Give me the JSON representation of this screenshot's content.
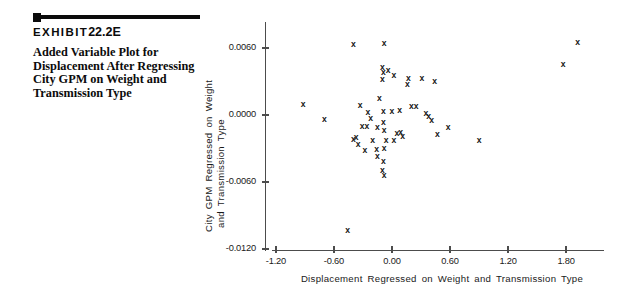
{
  "exhibit": {
    "label_prefix": "EXHIBIT",
    "label_number": "22.2E",
    "caption": "Added Variable Plot for Displacement After Regressing City GPM on Weight and Transmission Type"
  },
  "chart_data": {
    "type": "scatter",
    "title": "",
    "xlabel": "Displacement Regressed on Weight and Transmission Type",
    "ylabel": "City GPM Regressed on Weight and Transmission Type",
    "ylabel_line1": "City GPM Regressed on Weight",
    "ylabel_line2": "and Transmission Type",
    "marker": "x",
    "grid": false,
    "legend": "none",
    "xlim": [
      -1.42,
      2.0
    ],
    "ylim": [
      -0.0135,
      0.0085
    ],
    "xticks": [
      -1.2,
      -0.6,
      0.0,
      0.6,
      1.2,
      1.8
    ],
    "xtick_labels": [
      "-1.20",
      "-0.60",
      "0.00",
      "0.60",
      "1.20",
      "1.80"
    ],
    "yticks": [
      0.006,
      0.0,
      -0.006,
      -0.012
    ],
    "ytick_labels": [
      "0.0060",
      "0.0000",
      "-0.0060",
      "-0.0120"
    ],
    "points": [
      {
        "x": -0.4,
        "y": 0.00635
      },
      {
        "x": -0.08,
        "y": 0.0064
      },
      {
        "x": -0.92,
        "y": 0.0009
      },
      {
        "x": -0.7,
        "y": -0.0004
      },
      {
        "x": -0.1,
        "y": 0.00425
      },
      {
        "x": -0.09,
        "y": 0.00385
      },
      {
        "x": -0.04,
        "y": 0.004
      },
      {
        "x": -0.1,
        "y": 0.00315
      },
      {
        "x": 0.02,
        "y": 0.00355
      },
      {
        "x": 0.17,
        "y": 0.0033
      },
      {
        "x": 0.31,
        "y": 0.0033
      },
      {
        "x": 0.16,
        "y": 0.00275
      },
      {
        "x": 0.44,
        "y": 0.003
      },
      {
        "x": -0.33,
        "y": 0.00085
      },
      {
        "x": -0.13,
        "y": 0.0015
      },
      {
        "x": -0.25,
        "y": 0.0002
      },
      {
        "x": -0.22,
        "y": -0.00035
      },
      {
        "x": -0.09,
        "y": 0.00035
      },
      {
        "x": 0.0,
        "y": 0.0003
      },
      {
        "x": 0.08,
        "y": 0.0004
      },
      {
        "x": 0.2,
        "y": 0.00075
      },
      {
        "x": 0.25,
        "y": 0.00075
      },
      {
        "x": 0.35,
        "y": 0.0001
      },
      {
        "x": 0.38,
        "y": -0.0001
      },
      {
        "x": 0.41,
        "y": -0.00045
      },
      {
        "x": -0.31,
        "y": -0.001
      },
      {
        "x": -0.26,
        "y": -0.00105
      },
      {
        "x": -0.15,
        "y": -0.0011
      },
      {
        "x": -0.09,
        "y": -0.0007
      },
      {
        "x": -0.08,
        "y": -0.00135
      },
      {
        "x": 0.05,
        "y": -0.00165
      },
      {
        "x": 0.09,
        "y": -0.00155
      },
      {
        "x": 0.11,
        "y": -0.00195
      },
      {
        "x": 0.58,
        "y": -0.00115
      },
      {
        "x": -0.4,
        "y": -0.00215
      },
      {
        "x": -0.37,
        "y": -0.00205
      },
      {
        "x": -0.35,
        "y": -0.00265
      },
      {
        "x": -0.2,
        "y": -0.0023
      },
      {
        "x": -0.06,
        "y": -0.00225
      },
      {
        "x": 0.02,
        "y": -0.0023
      },
      {
        "x": -0.28,
        "y": -0.0032
      },
      {
        "x": -0.16,
        "y": -0.0031
      },
      {
        "x": -0.08,
        "y": -0.003
      },
      {
        "x": -0.15,
        "y": -0.0037
      },
      {
        "x": -0.09,
        "y": -0.00415
      },
      {
        "x": -0.1,
        "y": -0.005
      },
      {
        "x": -0.08,
        "y": -0.00545
      },
      {
        "x": 0.47,
        "y": -0.00175
      },
      {
        "x": 0.9,
        "y": -0.0023
      },
      {
        "x": 1.77,
        "y": 0.0045
      },
      {
        "x": 1.92,
        "y": 0.0065
      },
      {
        "x": -0.46,
        "y": -0.0103
      }
    ]
  }
}
